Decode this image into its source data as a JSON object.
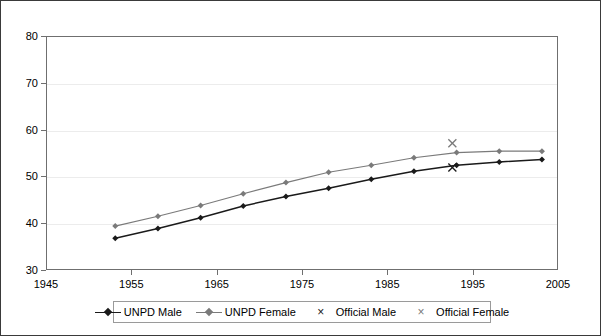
{
  "chart_data": {
    "type": "line",
    "title": "",
    "subtitle": "",
    "xlabel": "",
    "ylabel": "",
    "xlim": [
      1945,
      2005
    ],
    "ylim": [
      30,
      80
    ],
    "xticks": [
      1945,
      1955,
      1965,
      1975,
      1985,
      1995,
      2005
    ],
    "yticks": [
      30,
      40,
      50,
      60,
      70,
      80
    ],
    "grid": "horizontal",
    "legend_position": "bottom-center",
    "series": [
      {
        "name": "UNPD Male",
        "type": "line",
        "color": "#1a1a1a",
        "marker": "diamond",
        "x": [
          1953,
          1958,
          1963,
          1968,
          1973,
          1978,
          1983,
          1988,
          1993,
          1998,
          2003
        ],
        "values": [
          37.0,
          39.1,
          41.4,
          43.9,
          45.9,
          47.7,
          49.6,
          51.3,
          52.6,
          53.3,
          53.8
        ]
      },
      {
        "name": "UNPD Female",
        "type": "line",
        "color": "#7a7a7a",
        "marker": "diamond",
        "x": [
          1953,
          1958,
          1963,
          1968,
          1973,
          1978,
          1983,
          1988,
          1993,
          1998,
          2003
        ],
        "values": [
          39.6,
          41.7,
          44.0,
          46.5,
          48.9,
          51.1,
          52.6,
          54.2,
          55.3,
          55.6,
          55.6
        ]
      },
      {
        "name": "Official Male",
        "type": "scatter",
        "color": "#1a1a1a",
        "marker": "x",
        "x": [
          1992.5
        ],
        "values": [
          52.1
        ]
      },
      {
        "name": "Official Female",
        "type": "scatter",
        "color": "#7a7a7a",
        "marker": "x",
        "x": [
          1992.5
        ],
        "values": [
          57.3
        ]
      }
    ]
  },
  "axes": {
    "y_labels": [
      "80",
      "70",
      "60",
      "50",
      "40",
      "30"
    ],
    "x_labels": [
      "1945",
      "1955",
      "1965",
      "1975",
      "1985",
      "1995",
      "2005"
    ]
  },
  "legend": {
    "items": [
      {
        "label": "UNPD Male",
        "glyph": "line-diamond",
        "color": "#1a1a1a"
      },
      {
        "label": "UNPD Female",
        "glyph": "line-diamond",
        "color": "#7a7a7a"
      },
      {
        "label": "Official Male",
        "glyph": "x-mark",
        "color": "#1a1a1a"
      },
      {
        "label": "Official Female",
        "glyph": "x-mark",
        "color": "#7a7a7a"
      }
    ]
  },
  "colors": {
    "male": "#1a1a1a",
    "female": "#7a7a7a",
    "gridline": "#ececec",
    "plot_border": "#6f6f6f",
    "frame_border": "#3a3a3a",
    "background": "#ffffff"
  }
}
